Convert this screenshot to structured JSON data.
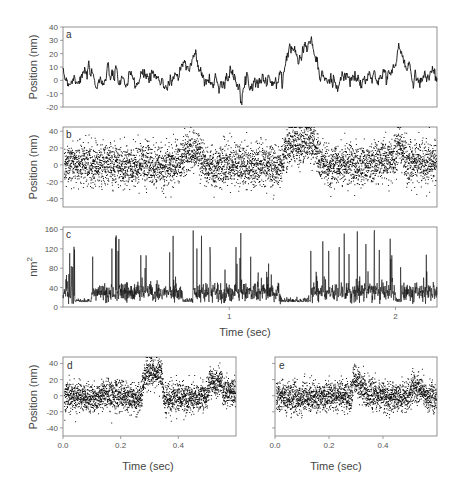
{
  "chart_data": [
    {
      "panel": "a",
      "type": "line",
      "title": "",
      "xlabel": "",
      "ylabel": "Position (nm)",
      "ylim": [
        -20,
        40
      ],
      "yticks": [
        -20,
        -10,
        0,
        10,
        20,
        30,
        40
      ],
      "xlim": [
        0,
        2.25
      ],
      "x": [
        0.0,
        0.1,
        0.2,
        0.3,
        0.4,
        0.5,
        0.6,
        0.7,
        0.75,
        0.8,
        0.85,
        0.9,
        1.0,
        1.1,
        1.2,
        1.3,
        1.35,
        1.4,
        1.5,
        1.55,
        1.6,
        1.7,
        1.8,
        1.9,
        2.0,
        2.02,
        2.05,
        2.1,
        2.2,
        2.25
      ],
      "values": [
        0,
        4,
        0,
        2,
        -3,
        3,
        -4,
        6,
        17,
        16,
        0,
        -2,
        3,
        -1,
        1,
        -3,
        22,
        23,
        27,
        2,
        -2,
        2,
        -2,
        4,
        7,
        28,
        12,
        3,
        4,
        5
      ],
      "grid": false
    },
    {
      "panel": "b",
      "type": "scatter",
      "xlabel": "",
      "ylabel": "Position (nm)",
      "ylim": [
        -50,
        45
      ],
      "yticks": [
        -40,
        -20,
        0,
        20,
        40
      ],
      "xlim": [
        0,
        2.25
      ],
      "x": [
        0.0,
        0.1,
        0.2,
        0.3,
        0.4,
        0.5,
        0.6,
        0.7,
        0.75,
        0.8,
        0.85,
        0.9,
        1.0,
        1.1,
        1.2,
        1.3,
        1.35,
        1.4,
        1.5,
        1.55,
        1.6,
        1.7,
        1.8,
        1.9,
        2.0,
        2.02,
        2.05,
        2.1,
        2.2,
        2.25
      ],
      "values": [
        0,
        4,
        0,
        2,
        -3,
        3,
        -4,
        6,
        17,
        16,
        0,
        -2,
        3,
        -1,
        1,
        -3,
        22,
        23,
        27,
        2,
        -2,
        2,
        -2,
        4,
        7,
        28,
        12,
        3,
        4,
        5
      ],
      "noise_sd_nm": 12,
      "grid": false
    },
    {
      "panel": "c",
      "type": "line",
      "xlabel": "Time (sec)",
      "ylabel": "nm2",
      "ylim": [
        0,
        165
      ],
      "yticks": [
        0,
        40,
        80,
        120,
        160
      ],
      "xlim": [
        0,
        2.25
      ],
      "xticks": [
        1,
        2
      ],
      "low_variance_intervals_sec": [
        [
          0.07,
          0.17
        ],
        [
          0.72,
          0.78
        ],
        [
          1.31,
          1.49
        ],
        [
          2.0,
          2.03
        ]
      ],
      "baseline_low": 10,
      "baseline_high": 30,
      "spike_max": 160,
      "grid": false
    },
    {
      "panel": "d",
      "type": "scatter",
      "xlabel": "Time (sec)",
      "ylabel": "Position (nm)",
      "ylim": [
        -50,
        48
      ],
      "yticks": [
        -40,
        -20,
        0,
        20,
        40
      ],
      "xlim": [
        0,
        0.6
      ],
      "xticks": [
        0.0,
        0.2,
        0.4
      ],
      "x": [
        0.0,
        0.05,
        0.1,
        0.15,
        0.2,
        0.25,
        0.27,
        0.28,
        0.3,
        0.33,
        0.34,
        0.35,
        0.4,
        0.45,
        0.5,
        0.51,
        0.55,
        0.56,
        0.6
      ],
      "values": [
        0,
        0,
        -3,
        2,
        0,
        -2,
        0,
        25,
        30,
        28,
        30,
        -5,
        0,
        -3,
        0,
        18,
        18,
        5,
        5
      ],
      "noise_sd_nm": 9
    },
    {
      "panel": "e",
      "type": "scatter",
      "xlabel": "Time (sec)",
      "ylabel": "",
      "ylim": [
        -50,
        48
      ],
      "yticks": [
        -40,
        -20,
        0,
        20,
        40
      ],
      "xlim": [
        0,
        0.6
      ],
      "xticks": [
        0.0,
        0.2,
        0.4
      ],
      "x": [
        0.0,
        0.05,
        0.1,
        0.15,
        0.2,
        0.25,
        0.28,
        0.29,
        0.3,
        0.35,
        0.4,
        0.45,
        0.5,
        0.51,
        0.55,
        0.56,
        0.6
      ],
      "values": [
        0,
        -3,
        -2,
        0,
        0,
        0,
        0,
        20,
        18,
        2,
        0,
        -2,
        0,
        10,
        10,
        0,
        0
      ],
      "noise_sd_nm": 9
    }
  ],
  "labels": {
    "panel_a": "a",
    "panel_b": "b",
    "panel_c": "c",
    "panel_d": "d",
    "panel_e": "e",
    "ylabel_a": "Position (nm)",
    "ylabel_b": "Position (nm)",
    "ylabel_c_base": "nm",
    "ylabel_c_sup": "2",
    "ylabel_d": "Position (nm)",
    "xlabel_c": "Time (sec)",
    "xlabel_d": "Time (sec)",
    "xlabel_e": "Time (sec)"
  },
  "colors": {
    "trace": "#111111",
    "axis": "#777777",
    "text": "#444444"
  }
}
